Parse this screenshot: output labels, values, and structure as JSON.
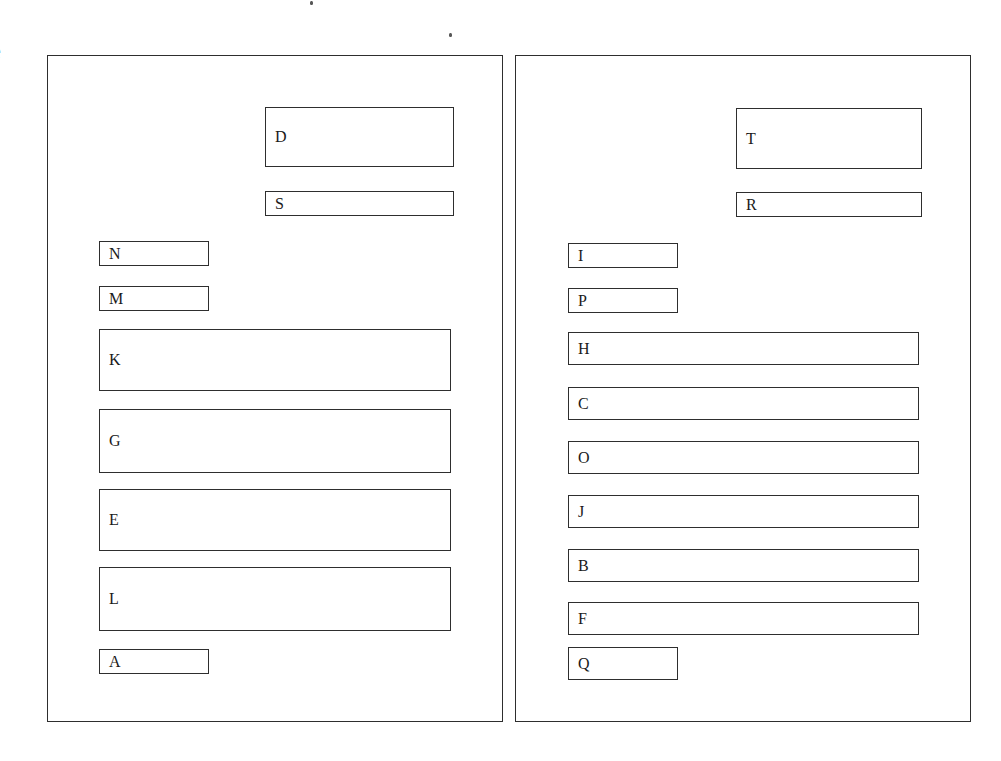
{
  "page": {
    "background": "#ffffff",
    "ink": "#1a1a1a",
    "border_color": "#2e2e2e",
    "width": 1001,
    "height": 761,
    "margin_glyph": "e"
  },
  "panels": [
    {
      "id": "left-panel",
      "name": "left-panel",
      "x": 47,
      "y": 55,
      "width": 456,
      "height": 667,
      "nodes": [
        {
          "label": "D",
          "x": 264,
          "y": 106,
          "width": 189,
          "height": 60,
          "size": "tall"
        },
        {
          "label": "S",
          "x": 264,
          "y": 190,
          "width": 189,
          "height": 25,
          "size": "small"
        },
        {
          "label": "N",
          "x": 98,
          "y": 240,
          "width": 110,
          "height": 25,
          "size": "small"
        },
        {
          "label": "M",
          "x": 98,
          "y": 285,
          "width": 110,
          "height": 25,
          "size": "small"
        },
        {
          "label": "K",
          "x": 98,
          "y": 328,
          "width": 352,
          "height": 62,
          "size": "tall"
        },
        {
          "label": "G",
          "x": 98,
          "y": 408,
          "width": 352,
          "height": 64,
          "size": "tall"
        },
        {
          "label": "E",
          "x": 98,
          "y": 488,
          "width": 352,
          "height": 62,
          "size": "tall"
        },
        {
          "label": "L",
          "x": 98,
          "y": 566,
          "width": 352,
          "height": 64,
          "size": "tall"
        },
        {
          "label": "A",
          "x": 98,
          "y": 648,
          "width": 110,
          "height": 25,
          "size": "small"
        }
      ]
    },
    {
      "id": "right-panel",
      "name": "right-panel",
      "x": 515,
      "y": 55,
      "width": 456,
      "height": 667,
      "nodes": [
        {
          "label": "T",
          "x": 735,
          "y": 107,
          "width": 186,
          "height": 61,
          "size": "tall"
        },
        {
          "label": "R",
          "x": 735,
          "y": 191,
          "width": 186,
          "height": 25,
          "size": "small"
        },
        {
          "label": "I",
          "x": 567,
          "y": 242,
          "width": 110,
          "height": 25,
          "size": "small"
        },
        {
          "label": "P",
          "x": 567,
          "y": 287,
          "width": 110,
          "height": 25,
          "size": "small"
        },
        {
          "label": "H",
          "x": 567,
          "y": 331,
          "width": 351,
          "height": 33,
          "size": "small"
        },
        {
          "label": "C",
          "x": 567,
          "y": 386,
          "width": 351,
          "height": 33,
          "size": "small"
        },
        {
          "label": "O",
          "x": 567,
          "y": 440,
          "width": 351,
          "height": 33,
          "size": "small"
        },
        {
          "label": "J",
          "x": 567,
          "y": 494,
          "width": 351,
          "height": 33,
          "size": "small"
        },
        {
          "label": "B",
          "x": 567,
          "y": 548,
          "width": 351,
          "height": 33,
          "size": "small"
        },
        {
          "label": "F",
          "x": 567,
          "y": 601,
          "width": 351,
          "height": 33,
          "size": "small"
        },
        {
          "label": "Q",
          "x": 567,
          "y": 646,
          "width": 110,
          "height": 33,
          "size": "small"
        }
      ]
    }
  ],
  "artifacts": [
    {
      "name": "scan-speck",
      "x": 310,
      "y": 1
    },
    {
      "name": "scan-speck",
      "x": 449,
      "y": 33
    }
  ]
}
